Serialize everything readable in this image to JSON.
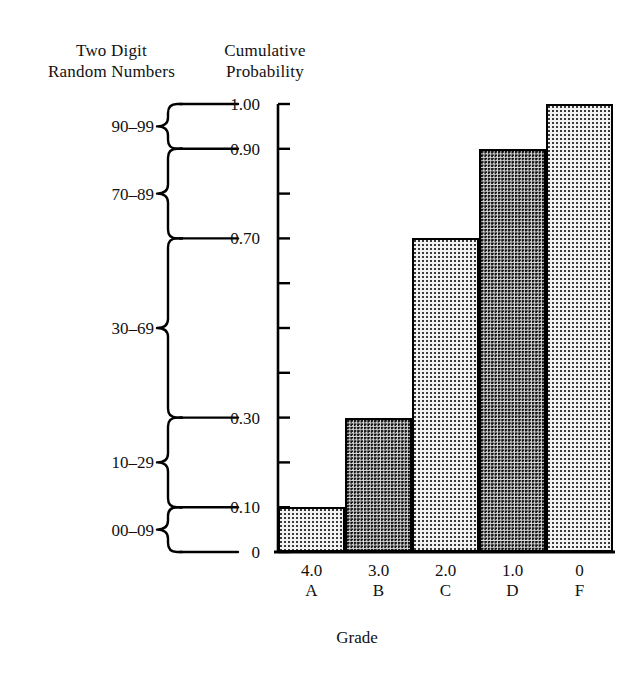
{
  "headers": {
    "left_line1": "Two Digit",
    "left_line2": "Random Numbers",
    "right_line1": "Cumulative",
    "right_line2": "Probability"
  },
  "random_number_ranges": [
    {
      "label": "90–99",
      "from": 0.9,
      "to": 1.0
    },
    {
      "label": "70–89",
      "from": 0.7,
      "to": 0.9
    },
    {
      "label": "30–69",
      "from": 0.3,
      "to": 0.7
    },
    {
      "label": "10–29",
      "from": 0.1,
      "to": 0.3
    },
    {
      "label": "00–09",
      "from": 0.0,
      "to": 0.1
    }
  ],
  "chart_data": {
    "type": "bar",
    "title": "",
    "xlabel": "Grade",
    "ylabel": "Cumulative Probability",
    "categories": [
      "4.0",
      "3.0",
      "2.0",
      "1.0",
      "0"
    ],
    "category_letters": [
      "A",
      "B",
      "C",
      "D",
      "F"
    ],
    "values": [
      0.1,
      0.3,
      0.7,
      0.9,
      1.0
    ],
    "ylim": [
      0,
      1.0
    ],
    "ytick_labels": [
      "1.00",
      "0.90",
      "0.70",
      "0.30",
      "0.10",
      "0"
    ],
    "ytick_values": [
      1.0,
      0.9,
      0.7,
      0.3,
      0.1,
      0
    ],
    "ytick_minor_values": [
      0.2,
      0.4,
      0.5,
      0.6,
      0.8
    ],
    "grid": false,
    "legend": false,
    "bar_fills": [
      "light",
      "dark",
      "light",
      "dark",
      "light"
    ]
  },
  "colors": {
    "ink": "#000000",
    "background": "#ffffff",
    "bar_light": "#f2f2f2",
    "bar_dark": "#d8d8d8"
  }
}
